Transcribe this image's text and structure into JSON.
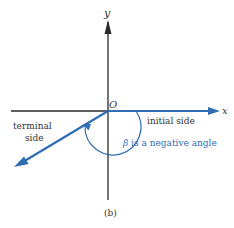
{
  "diagram": {
    "axis_labels": {
      "x": "x",
      "y": "y",
      "origin": "O"
    },
    "labels": {
      "initial_side": "initial side",
      "terminal_line1": "terminal",
      "terminal_line2": "side",
      "angle_symbol": "β",
      "angle_text": " is a negative angle"
    },
    "caption": "(b)",
    "colors": {
      "axis": "#2a2a2a",
      "accent": "#2f6db5",
      "text": "#333333"
    }
  }
}
